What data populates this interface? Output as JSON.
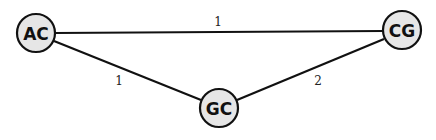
{
  "diagram": {
    "type": "weighted-graph",
    "colors": {
      "node_fill": "#e6e6e6",
      "node_stroke": "#111111",
      "edge": "#111111",
      "text": "#111111"
    },
    "nodes": [
      {
        "id": "AC",
        "label": "AC",
        "x": 36,
        "y": 33
      },
      {
        "id": "CG",
        "label": "CG",
        "x": 402,
        "y": 30
      },
      {
        "id": "GC",
        "label": "GC",
        "x": 219,
        "y": 108
      }
    ],
    "edges": [
      {
        "from": "AC",
        "to": "CG",
        "weight": "1",
        "label_x": 218,
        "label_y": 26
      },
      {
        "from": "AC",
        "to": "GC",
        "weight": "1",
        "label_x": 119,
        "label_y": 84
      },
      {
        "from": "GC",
        "to": "CG",
        "weight": "2",
        "label_x": 318,
        "label_y": 84
      }
    ]
  }
}
